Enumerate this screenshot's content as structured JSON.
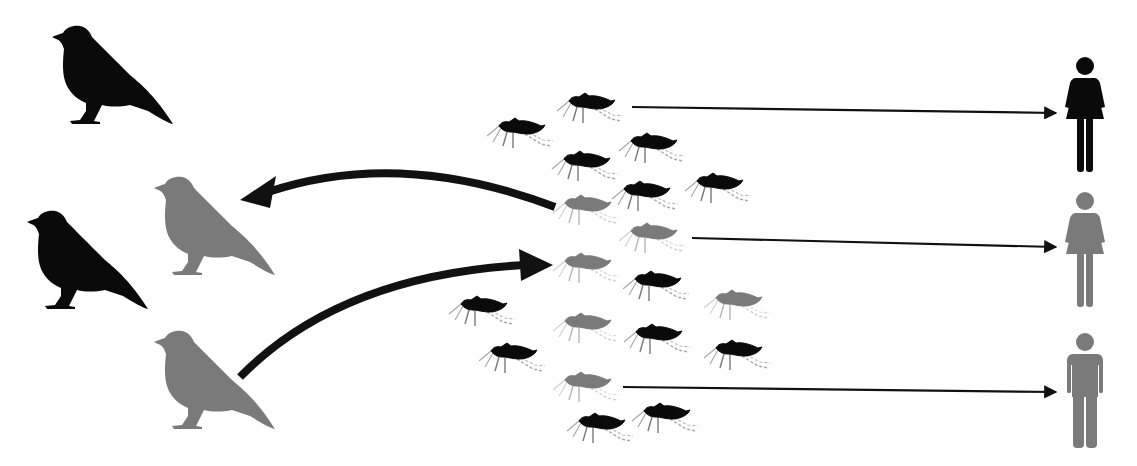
{
  "title": "Mosquito-borne transmission between birds and humans",
  "colors": {
    "uninfected": "#0a0a0a",
    "infected": "#7a7a7a",
    "background": "#ffffff",
    "arrow": "#111111"
  },
  "legend_semantics": {
    "black": "uninfected",
    "gray": "infected"
  },
  "birds": [
    {
      "id": "bird-1",
      "x": 50,
      "y": 25,
      "status": "uninfected"
    },
    {
      "id": "bird-2",
      "x": 25,
      "y": 210,
      "status": "uninfected"
    },
    {
      "id": "bird-3",
      "x": 152,
      "y": 176,
      "status": "infected"
    },
    {
      "id": "bird-4",
      "x": 152,
      "y": 330,
      "status": "infected"
    }
  ],
  "mosquitoes": [
    {
      "x": 590,
      "y": 105,
      "status": "uninfected"
    },
    {
      "x": 520,
      "y": 130,
      "status": "uninfected"
    },
    {
      "x": 652,
      "y": 145,
      "status": "uninfected"
    },
    {
      "x": 585,
      "y": 163,
      "status": "uninfected"
    },
    {
      "x": 718,
      "y": 185,
      "status": "uninfected"
    },
    {
      "x": 645,
      "y": 193,
      "status": "uninfected"
    },
    {
      "x": 586,
      "y": 207,
      "status": "infected"
    },
    {
      "x": 652,
      "y": 235,
      "status": "infected"
    },
    {
      "x": 586,
      "y": 265,
      "status": "infected"
    },
    {
      "x": 656,
      "y": 283,
      "status": "uninfected"
    },
    {
      "x": 482,
      "y": 308,
      "status": "uninfected"
    },
    {
      "x": 737,
      "y": 302,
      "status": "infected"
    },
    {
      "x": 586,
      "y": 325,
      "status": "infected"
    },
    {
      "x": 657,
      "y": 336,
      "status": "uninfected"
    },
    {
      "x": 737,
      "y": 352,
      "status": "uninfected"
    },
    {
      "x": 512,
      "y": 355,
      "status": "uninfected"
    },
    {
      "x": 586,
      "y": 384,
      "status": "infected"
    },
    {
      "x": 600,
      "y": 425,
      "status": "uninfected"
    },
    {
      "x": 665,
      "y": 415,
      "status": "uninfected"
    }
  ],
  "humans": [
    {
      "id": "human-1",
      "type": "female",
      "x": 1085,
      "y": 57,
      "status": "uninfected"
    },
    {
      "id": "human-2",
      "type": "female",
      "x": 1085,
      "y": 192,
      "status": "infected"
    },
    {
      "id": "human-3",
      "type": "male",
      "x": 1085,
      "y": 333,
      "status": "infected"
    }
  ],
  "arrows": [
    {
      "id": "mosquito-to-bird",
      "from": [
        555,
        207
      ],
      "to": [
        240,
        200
      ],
      "style": "thick-curved"
    },
    {
      "id": "bird-to-mosquito",
      "from": [
        240,
        377
      ],
      "to": [
        553,
        265
      ],
      "style": "thick-curved"
    },
    {
      "id": "mosquito-to-human-1",
      "from": [
        632,
        107
      ],
      "to": [
        1056,
        113
      ],
      "style": "thin"
    },
    {
      "id": "mosquito-to-human-2",
      "from": [
        692,
        238
      ],
      "to": [
        1056,
        247
      ],
      "style": "thin"
    },
    {
      "id": "mosquito-to-human-3",
      "from": [
        623,
        387
      ],
      "to": [
        1056,
        392
      ],
      "style": "thin"
    }
  ]
}
